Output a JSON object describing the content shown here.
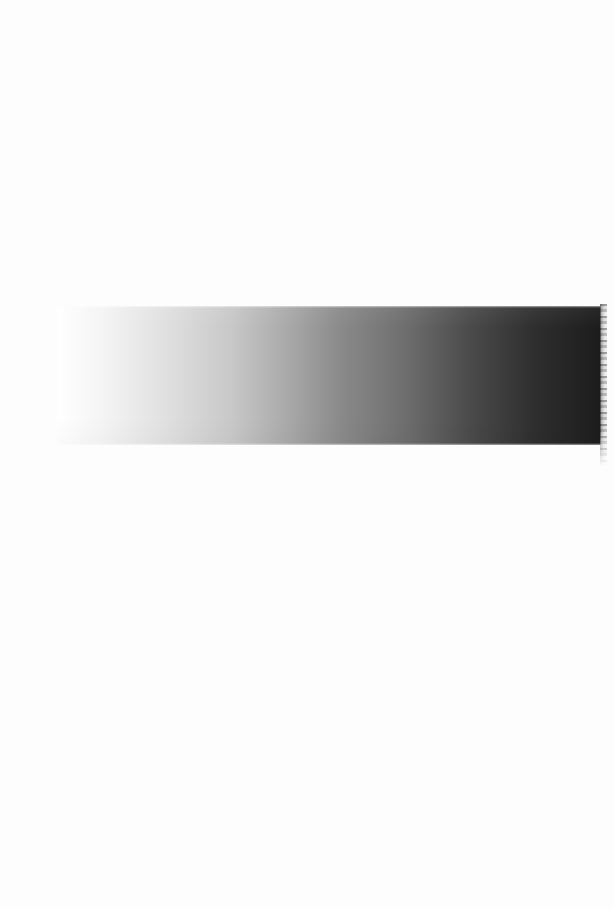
{
  "page": {
    "width": 614,
    "height": 908,
    "background_color": "#fdfdfd",
    "content_description": "Blank scanned page containing a single horizontal grayscale gradient test strip"
  },
  "gradient_bar": {
    "label": "grayscale-gradient-strip",
    "x": 57,
    "y": 306,
    "width": 544,
    "height": 139,
    "direction": "left-to-right",
    "start_color": "#ffffff",
    "end_color": "#1c1c1c",
    "stops": [
      {
        "position_pct": 0,
        "color": "#ffffff"
      },
      {
        "position_pct": 8,
        "color": "#f5f5f5"
      },
      {
        "position_pct": 20,
        "color": "#e0e0e0"
      },
      {
        "position_pct": 32,
        "color": "#c8c8c8"
      },
      {
        "position_pct": 44,
        "color": "#a4a4a4"
      },
      {
        "position_pct": 52,
        "color": "#8a8a8a"
      },
      {
        "position_pct": 64,
        "color": "#6e6e6e"
      },
      {
        "position_pct": 76,
        "color": "#4a4a4a"
      },
      {
        "position_pct": 88,
        "color": "#2e2e2e"
      },
      {
        "position_pct": 100,
        "color": "#1c1c1c"
      }
    ]
  },
  "right_edge_artifact": {
    "label": "scan-edge-artifact",
    "x": 600,
    "y": 304,
    "width": 7,
    "height": 161,
    "color": "#787878"
  },
  "chart_data": {
    "type": "heatmap",
    "title": "",
    "subtitle": "",
    "xlabel": "",
    "ylabel": "",
    "grid": false,
    "legend": "none",
    "colormap": "grayscale",
    "orientation": "horizontal",
    "x": [
      0,
      10,
      20,
      30,
      40,
      50,
      60,
      70,
      80,
      90,
      100
    ],
    "values": [
      255,
      244,
      224,
      205,
      176,
      138,
      116,
      92,
      74,
      46,
      28
    ],
    "xlim": [
      0,
      100
    ],
    "ylim": [
      0,
      255
    ],
    "tick_labels": []
  }
}
